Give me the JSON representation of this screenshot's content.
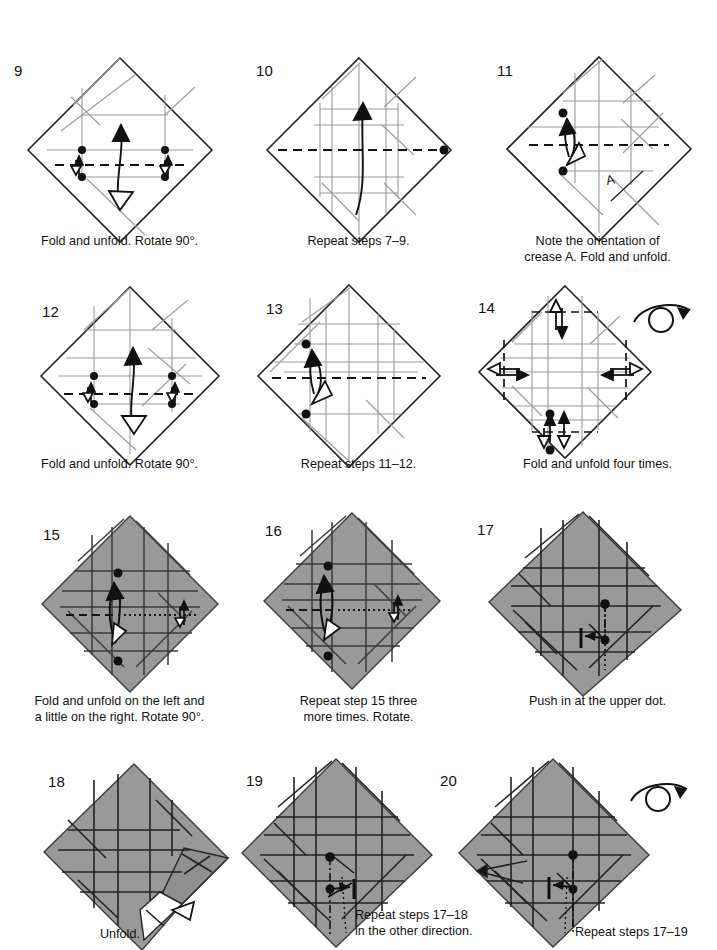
{
  "document": {
    "kind": "origami-instruction-diagram-page",
    "page_background": "#ffffff",
    "ink_color": "#111111",
    "paper_gray": "#999999",
    "paper_white": "#ffffff"
  },
  "symbols": {
    "turn_over": "turn-over-loop-arrow",
    "valley_fold": "dashed-line",
    "mountain_fold": "dash-dot-line",
    "existing_crease": "thin-gray-line",
    "fold_and_unfold": "double-headed-arrow-with-hollow-tip",
    "reference_point": "filled-dot",
    "push_in": "short-bar-with-arrow"
  },
  "panels": [
    {
      "number": "9",
      "caption": "Fold and unfold. Rotate 90°.",
      "shaded": false,
      "turn_over": false,
      "num_x": 14,
      "num_y": 62,
      "cap_x": 0,
      "cap_y": 234,
      "cap_w": 239
    },
    {
      "number": "10",
      "caption": "Repeat steps 7–9.",
      "shaded": false,
      "turn_over": false,
      "num_x": 256,
      "num_y": 62,
      "cap_x": 239,
      "cap_y": 234,
      "cap_w": 239
    },
    {
      "number": "11",
      "caption": "Note the orientation of\ncrease A. Fold and unfold.",
      "shaded": false,
      "turn_over": false,
      "label_A": "A",
      "num_x": 497,
      "num_y": 62,
      "cap_x": 478,
      "cap_y": 234,
      "cap_w": 239
    },
    {
      "number": "12",
      "caption": "Fold and unfold. Rotate 90°.",
      "shaded": false,
      "turn_over": false,
      "num_x": 42,
      "num_y": 303,
      "cap_x": 0,
      "cap_y": 457,
      "cap_w": 239
    },
    {
      "number": "13",
      "caption": "Repeat steps 11–12.",
      "shaded": false,
      "turn_over": false,
      "num_x": 266,
      "num_y": 300,
      "cap_x": 239,
      "cap_y": 457,
      "cap_w": 239
    },
    {
      "number": "14",
      "caption": "Fold and unfold four times.",
      "shaded": false,
      "turn_over": true,
      "num_x": 478,
      "num_y": 299,
      "cap_x": 478,
      "cap_y": 457,
      "cap_w": 239
    },
    {
      "number": "15",
      "caption": "Fold and unfold on the left and\na little on the right. Rotate 90°.",
      "shaded": true,
      "turn_over": false,
      "num_x": 43,
      "num_y": 526,
      "cap_x": 0,
      "cap_y": 694,
      "cap_w": 239
    },
    {
      "number": "16",
      "caption": "Repeat step 15 three\nmore times. Rotate.",
      "shaded": true,
      "turn_over": false,
      "num_x": 265,
      "num_y": 522,
      "cap_x": 239,
      "cap_y": 694,
      "cap_w": 239
    },
    {
      "number": "17",
      "caption": "Push in at the upper dot.",
      "shaded": true,
      "turn_over": false,
      "num_x": 477,
      "num_y": 521,
      "cap_x": 478,
      "cap_y": 694,
      "cap_w": 239
    },
    {
      "number": "18",
      "caption": "Unfold.",
      "shaded": true,
      "turn_over": false,
      "num_x": 48,
      "num_y": 773,
      "cap_x": 100,
      "cap_y": 927,
      "cap_w": 160
    },
    {
      "number": "19",
      "caption": "Repeat steps 17–18\nin the other direction.",
      "shaded": true,
      "turn_over": false,
      "num_x": 246,
      "num_y": 772,
      "cap_x": 355,
      "cap_y": 908,
      "cap_w": 160
    },
    {
      "number": "20",
      "caption": "Repeat steps 17–19\n",
      "shaded": true,
      "turn_over": true,
      "num_x": 690,
      "num_y": 772,
      "cap_x": 575,
      "cap_y": 925,
      "cap_w": 160
    }
  ]
}
